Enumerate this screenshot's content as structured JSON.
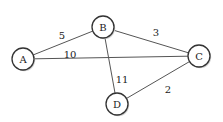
{
  "diagram": {
    "type": "weighted-undirected-graph",
    "nodes": [
      {
        "id": "A",
        "label": "A",
        "x": 23,
        "y": 59,
        "r": 11
      },
      {
        "id": "B",
        "label": "B",
        "x": 103,
        "y": 27,
        "r": 11
      },
      {
        "id": "C",
        "label": "C",
        "x": 199,
        "y": 56,
        "r": 11
      },
      {
        "id": "D",
        "label": "D",
        "x": 117,
        "y": 104,
        "r": 11
      }
    ],
    "edges": [
      {
        "from": "A",
        "to": "B",
        "weight": "5",
        "label_x": 62,
        "label_y": 35
      },
      {
        "from": "A",
        "to": "C",
        "weight": "10",
        "label_x": 70,
        "label_y": 54
      },
      {
        "from": "B",
        "to": "C",
        "weight": "3",
        "label_x": 156,
        "label_y": 32
      },
      {
        "from": "B",
        "to": "D",
        "weight": "11",
        "label_x": 122,
        "label_y": 79
      },
      {
        "from": "C",
        "to": "D",
        "weight": "2",
        "label_x": 168,
        "label_y": 89
      }
    ]
  }
}
